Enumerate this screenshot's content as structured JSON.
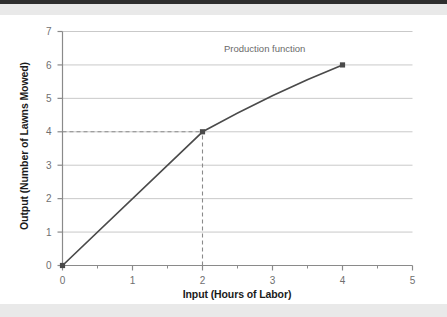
{
  "chart_data": {
    "type": "line",
    "title": "",
    "subtitle": "",
    "xlabel": "Input (Hours of Labor)",
    "ylabel": "Output (Number of Lawns Mowed)",
    "xlim": [
      0,
      5
    ],
    "ylim": [
      0,
      7
    ],
    "xticks": [
      0,
      1,
      2,
      3,
      4,
      5
    ],
    "xtick_labels": [
      "0",
      "1",
      "2",
      "3",
      "4",
      "5"
    ],
    "xminor_ticks": [
      0.5,
      1.5,
      2.5,
      3.5,
      4.5
    ],
    "yticks": [
      0,
      1,
      2,
      3,
      4,
      5,
      6,
      7
    ],
    "ytick_labels": [
      "0",
      "1",
      "2",
      "3",
      "4",
      "5",
      "6",
      "7"
    ],
    "grid": "horizontal",
    "legend": "none",
    "series": [
      {
        "name": "Production function",
        "marker": "square",
        "color": "#4a4a4a",
        "x": [
          0,
          2,
          4
        ],
        "values": [
          0,
          4,
          6
        ],
        "points": [
          {
            "x": 0,
            "y": 0
          },
          {
            "x": 2,
            "y": 4
          },
          {
            "x": 4,
            "y": 6
          }
        ]
      }
    ],
    "annotations": [
      {
        "text": "Production function",
        "x": 3.05,
        "y": 6.45
      }
    ],
    "guide_lines": [
      {
        "type": "horizontal",
        "y": 4,
        "from_x": 0,
        "to_x": 2,
        "style": "dashed"
      },
      {
        "type": "vertical",
        "x": 2,
        "from_y": 0,
        "to_y": 4,
        "style": "dashed"
      }
    ]
  },
  "colors": {
    "line": "#4a4a4a",
    "marker": "#4a4a4a",
    "grid": "#c9c9c9",
    "axis": "#8a8a8a",
    "guide": "#8a8a8a",
    "tick_label": "#6f6f6f",
    "axis_title": "#1b1b1b",
    "annotation": "#6a6a6a",
    "scan_band": "#e9e9e9",
    "scan_edge": "#2e2e2e",
    "background": "#ffffff"
  }
}
